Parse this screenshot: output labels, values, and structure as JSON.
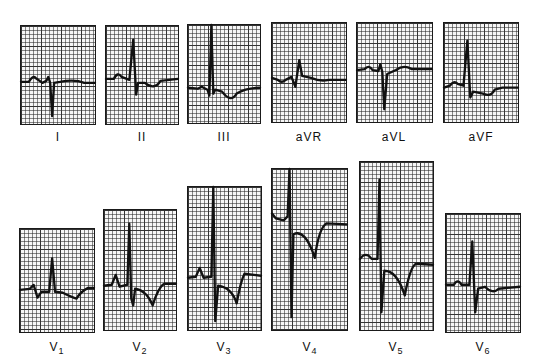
{
  "figure": {
    "type": "12-lead ECG",
    "leads": [
      {
        "id": "I",
        "label": "I",
        "sub": ""
      },
      {
        "id": "II",
        "label": "II",
        "sub": ""
      },
      {
        "id": "III",
        "label": "III",
        "sub": ""
      },
      {
        "id": "aVR",
        "label": "aVR",
        "sub": ""
      },
      {
        "id": "aVL",
        "label": "aVL",
        "sub": ""
      },
      {
        "id": "aVF",
        "label": "aVF",
        "sub": ""
      },
      {
        "id": "V1",
        "label": "V",
        "sub": "1"
      },
      {
        "id": "V2",
        "label": "V",
        "sub": "2"
      },
      {
        "id": "V3",
        "label": "V",
        "sub": "3"
      },
      {
        "id": "V4",
        "label": "V",
        "sub": "4"
      },
      {
        "id": "V5",
        "label": "V",
        "sub": "5"
      },
      {
        "id": "V6",
        "label": "V",
        "sub": "6"
      }
    ],
    "colors": {
      "trace": "#111111",
      "grid": "#333333",
      "background": "#ffffff"
    }
  }
}
